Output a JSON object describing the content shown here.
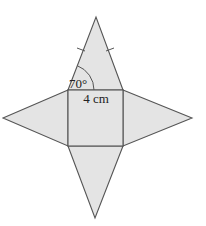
{
  "diagram": {
    "type": "net-of-square-pyramid",
    "faces": [
      "square base",
      "top triangle",
      "left triangle",
      "right triangle",
      "bottom triangle"
    ],
    "labels": {
      "angle": "70°",
      "side_length": "4 cm"
    },
    "annotations": {
      "equal_side_tick_marks": 2
    },
    "colors": {
      "fill": "#e4e4e4",
      "stroke": "#555555",
      "text": "#222222"
    }
  }
}
